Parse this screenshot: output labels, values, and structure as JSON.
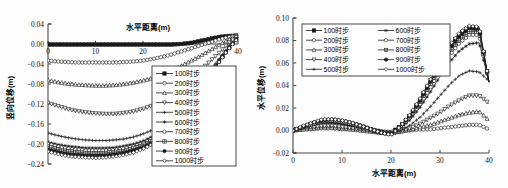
{
  "figure": {
    "background": "#fdfdfd",
    "ink": "#1a1a1a"
  },
  "charts": [
    {
      "id": "vertical-displacement",
      "xlabel": "水平距离(m)",
      "ylabel": "竖向位移(m)",
      "xticks": [
        "0",
        "10",
        "20",
        "40"
      ],
      "yticks": [
        "0.04",
        "0.00",
        "-0.04",
        "-0.08",
        "-0.12",
        "-0.16",
        "-0.20",
        "-0.24"
      ],
      "legend_position": "inside-lower-right",
      "legend_columns": 1
    },
    {
      "id": "horizontal-displacement",
      "xlabel": "水平距离(m)",
      "ylabel": "水平位移(m)",
      "xticks": [
        "0",
        "10",
        "20",
        "30",
        "40"
      ],
      "yticks": [
        "0.10",
        "0.08",
        "0.06",
        "0.04",
        "0.02",
        "0.00",
        "-0.02"
      ],
      "legend_position": "inside-upper-left",
      "legend_columns": 2
    }
  ],
  "chart_data": [
    {
      "type": "line",
      "title": "",
      "xlabel": "水平距离(m)",
      "ylabel": "竖向位移(m)",
      "xlim": [
        0,
        40
      ],
      "ylim": [
        -0.24,
        0.04
      ],
      "xticks": [
        0,
        10,
        20,
        40
      ],
      "yticks": [
        0.04,
        0.0,
        -0.04,
        -0.08,
        -0.12,
        -0.16,
        -0.2,
        -0.24
      ],
      "grid": false,
      "legend": [
        "100时步",
        "200时步",
        "300时步",
        "400时步",
        "500时步",
        "600时步",
        "700时步",
        "800时步",
        "900时步",
        "1000时步"
      ],
      "x": [
        0,
        2,
        4,
        6,
        8,
        10,
        12,
        14,
        16,
        18,
        20,
        22,
        24,
        26,
        28,
        30,
        32,
        34,
        36,
        38,
        40
      ],
      "series": [
        {
          "name": "100时步",
          "marker": "square-filled",
          "values": [
            -0.001,
            -0.001,
            -0.001,
            -0.001,
            -0.001,
            -0.001,
            -0.001,
            -0.001,
            -0.001,
            -0.001,
            -0.001,
            -0.001,
            -0.001,
            -0.001,
            0.0,
            0.002,
            0.006,
            0.01,
            0.014,
            0.016,
            0.017
          ]
        },
        {
          "name": "200时步",
          "marker": "circle-open",
          "values": [
            -0.033,
            -0.035,
            -0.036,
            -0.037,
            -0.037,
            -0.037,
            -0.037,
            -0.037,
            -0.036,
            -0.035,
            -0.033,
            -0.03,
            -0.026,
            -0.021,
            -0.015,
            -0.009,
            -0.003,
            0.003,
            0.009,
            0.014,
            0.017
          ]
        },
        {
          "name": "300时步",
          "marker": "triangle-open",
          "values": [
            -0.072,
            -0.076,
            -0.079,
            -0.081,
            -0.082,
            -0.083,
            -0.083,
            -0.082,
            -0.08,
            -0.077,
            -0.073,
            -0.068,
            -0.061,
            -0.053,
            -0.044,
            -0.034,
            -0.024,
            -0.013,
            -0.002,
            0.009,
            0.017
          ]
        },
        {
          "name": "400时步",
          "marker": "triangle-down-open",
          "values": [
            -0.118,
            -0.124,
            -0.13,
            -0.134,
            -0.137,
            -0.139,
            -0.14,
            -0.14,
            -0.138,
            -0.135,
            -0.13,
            -0.123,
            -0.113,
            -0.101,
            -0.087,
            -0.071,
            -0.054,
            -0.036,
            -0.018,
            0.002,
            0.016
          ]
        },
        {
          "name": "500时步",
          "marker": "cross",
          "values": [
            -0.178,
            -0.183,
            -0.187,
            -0.19,
            -0.192,
            -0.193,
            -0.193,
            -0.192,
            -0.19,
            -0.186,
            -0.18,
            -0.172,
            -0.16,
            -0.145,
            -0.127,
            -0.106,
            -0.082,
            -0.056,
            -0.03,
            -0.006,
            0.014
          ]
        },
        {
          "name": "600时步",
          "marker": "star",
          "values": [
            -0.196,
            -0.201,
            -0.204,
            -0.206,
            -0.208,
            -0.208,
            -0.208,
            -0.207,
            -0.204,
            -0.2,
            -0.194,
            -0.185,
            -0.172,
            -0.156,
            -0.136,
            -0.113,
            -0.088,
            -0.06,
            -0.033,
            -0.008,
            0.013
          ]
        },
        {
          "name": "700时步",
          "marker": "circle-open",
          "values": [
            -0.2,
            -0.205,
            -0.209,
            -0.211,
            -0.213,
            -0.213,
            -0.213,
            -0.212,
            -0.209,
            -0.205,
            -0.199,
            -0.189,
            -0.176,
            -0.16,
            -0.139,
            -0.116,
            -0.09,
            -0.062,
            -0.034,
            -0.009,
            0.013
          ]
        },
        {
          "name": "800时步",
          "marker": "plus-box",
          "values": [
            -0.205,
            -0.21,
            -0.214,
            -0.216,
            -0.218,
            -0.218,
            -0.218,
            -0.216,
            -0.214,
            -0.209,
            -0.202,
            -0.193,
            -0.18,
            -0.163,
            -0.142,
            -0.118,
            -0.092,
            -0.063,
            -0.035,
            -0.009,
            0.013
          ]
        },
        {
          "name": "900时步",
          "marker": "circle-filled",
          "values": [
            -0.211,
            -0.216,
            -0.22,
            -0.222,
            -0.223,
            -0.224,
            -0.223,
            -0.221,
            -0.218,
            -0.213,
            -0.207,
            -0.197,
            -0.183,
            -0.166,
            -0.145,
            -0.12,
            -0.093,
            -0.064,
            -0.035,
            -0.009,
            0.013
          ]
        },
        {
          "name": "1000时步",
          "marker": "diamond-open",
          "values": [
            -0.215,
            -0.22,
            -0.224,
            -0.226,
            -0.227,
            -0.228,
            -0.227,
            -0.225,
            -0.222,
            -0.217,
            -0.21,
            -0.2,
            -0.186,
            -0.169,
            -0.147,
            -0.122,
            -0.095,
            -0.065,
            -0.036,
            -0.01,
            0.012
          ]
        }
      ]
    },
    {
      "type": "line",
      "title": "",
      "xlabel": "水平距离(m)",
      "ylabel": "水平位移(m)",
      "xlim": [
        0,
        40
      ],
      "ylim": [
        -0.02,
        0.1
      ],
      "xticks": [
        0,
        10,
        20,
        30,
        40
      ],
      "yticks": [
        0.1,
        0.08,
        0.06,
        0.04,
        0.02,
        0.0,
        -0.02
      ],
      "grid": false,
      "legend": [
        "100时步",
        "200时步",
        "300时步",
        "400时步",
        "500时步",
        "600时步",
        "700时步",
        "800时步",
        "900时步",
        "1000时步"
      ],
      "x": [
        0,
        2,
        4,
        6,
        8,
        10,
        12,
        14,
        16,
        18,
        20,
        22,
        24,
        26,
        28,
        30,
        32,
        34,
        36,
        38,
        40
      ],
      "series": [
        {
          "name": "100时步",
          "marker": "square-filled",
          "values": [
            0.0,
            0.003,
            0.006,
            0.008,
            0.008,
            0.007,
            0.005,
            0.003,
            0.001,
            -0.001,
            -0.002,
            0.004,
            0.014,
            0.028,
            0.044,
            0.06,
            0.075,
            0.086,
            0.092,
            0.091,
            0.043
          ]
        },
        {
          "name": "200时步",
          "marker": "circle-open",
          "values": [
            0.0,
            0.001,
            0.001,
            0.002,
            0.002,
            0.001,
            0.001,
            0.0,
            0.0,
            -0.001,
            -0.001,
            0.0,
            0.0,
            0.001,
            0.001,
            0.002,
            0.003,
            0.004,
            0.005,
            0.005,
            0.001
          ]
        },
        {
          "name": "300时步",
          "marker": "triangle-open",
          "values": [
            0.0,
            0.001,
            0.002,
            0.003,
            0.003,
            0.002,
            0.001,
            0.0,
            -0.001,
            -0.002,
            -0.002,
            -0.001,
            0.001,
            0.003,
            0.005,
            0.008,
            0.011,
            0.014,
            0.016,
            0.017,
            0.009
          ]
        },
        {
          "name": "400时步",
          "marker": "triangle-down-open",
          "values": [
            0.0,
            0.002,
            0.003,
            0.004,
            0.004,
            0.003,
            0.002,
            0.001,
            -0.001,
            -0.002,
            -0.003,
            -0.001,
            0.002,
            0.006,
            0.011,
            0.016,
            0.022,
            0.027,
            0.031,
            0.031,
            0.024
          ]
        },
        {
          "name": "500时步",
          "marker": "cross",
          "values": [
            0.0,
            0.003,
            0.005,
            0.007,
            0.007,
            0.006,
            0.004,
            0.002,
            0.0,
            -0.002,
            -0.003,
            0.0,
            0.005,
            0.012,
            0.021,
            0.031,
            0.041,
            0.049,
            0.053,
            0.052,
            0.044
          ]
        },
        {
          "name": "600时步",
          "marker": "star",
          "values": [
            0.0,
            0.003,
            0.006,
            0.008,
            0.008,
            0.007,
            0.005,
            0.003,
            0.001,
            -0.002,
            -0.003,
            0.002,
            0.01,
            0.021,
            0.034,
            0.048,
            0.061,
            0.071,
            0.077,
            0.078,
            0.043
          ]
        },
        {
          "name": "700时步",
          "marker": "circle-open",
          "values": [
            0.0,
            0.003,
            0.006,
            0.008,
            0.009,
            0.008,
            0.006,
            0.003,
            0.001,
            -0.002,
            -0.003,
            0.003,
            0.012,
            0.024,
            0.038,
            0.053,
            0.067,
            0.078,
            0.085,
            0.085,
            0.043
          ]
        },
        {
          "name": "800时步",
          "marker": "plus-box",
          "values": [
            0.0,
            0.003,
            0.006,
            0.009,
            0.009,
            0.008,
            0.006,
            0.004,
            0.001,
            -0.002,
            -0.003,
            0.003,
            0.013,
            0.026,
            0.041,
            0.056,
            0.07,
            0.081,
            0.088,
            0.088,
            0.043
          ]
        },
        {
          "name": "900时步",
          "marker": "circle-filled",
          "values": [
            0.0,
            0.003,
            0.007,
            0.009,
            0.01,
            0.009,
            0.007,
            0.004,
            0.001,
            -0.002,
            -0.003,
            0.004,
            0.014,
            0.027,
            0.043,
            0.058,
            0.073,
            0.084,
            0.091,
            0.09,
            0.043
          ]
        },
        {
          "name": "1000时步",
          "marker": "diamond-open",
          "values": [
            0.0,
            0.004,
            0.007,
            0.01,
            0.01,
            0.009,
            0.007,
            0.004,
            0.001,
            -0.002,
            -0.004,
            0.004,
            0.015,
            0.029,
            0.045,
            0.061,
            0.076,
            0.087,
            0.093,
            0.092,
            0.043
          ]
        }
      ]
    }
  ]
}
